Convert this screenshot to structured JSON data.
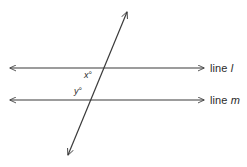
{
  "figure": {
    "background_color": "#ffffff",
    "stroke_color": "#3a3a3a",
    "text_color": "#2b2b2b",
    "width": 247,
    "height": 167
  },
  "labels": {
    "line_l": {
      "prefix": "line ",
      "name": "l"
    },
    "line_m": {
      "prefix": "line ",
      "name": "m"
    },
    "angle_x": {
      "variable": "x",
      "unit": "°"
    },
    "angle_y": {
      "variable": "y",
      "unit": "°"
    }
  },
  "geometry": {
    "line_l": {
      "x1": 10,
      "y1": 68,
      "x2": 204,
      "y2": 68,
      "arrows": "both"
    },
    "line_m": {
      "x1": 10,
      "y1": 100,
      "x2": 204,
      "y2": 100,
      "arrows": "both"
    },
    "transversal": {
      "x1": 68,
      "y1": 155,
      "x2": 127,
      "y2": 12,
      "arrows": "both"
    }
  }
}
